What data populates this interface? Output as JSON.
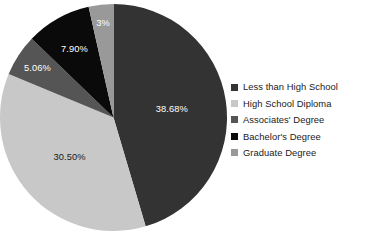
{
  "chart_data": {
    "type": "pie",
    "title": "",
    "subtitle": "",
    "xlabel": "",
    "ylabel": "",
    "legend_position": "right",
    "grid": false,
    "start_angle_deg": 0,
    "direction": "clockwise",
    "categories": [
      "Less than High School",
      "High School Diploma",
      "Associates' Degree",
      "Bachelor's Degree",
      "Graduate Degree"
    ],
    "values": [
      38.68,
      30.5,
      5.06,
      7.9,
      3.0
    ],
    "data_labels": [
      "38.68%",
      "30.50%",
      "5.06%",
      "7.90%",
      "3%"
    ],
    "colors": [
      "#333333",
      "#c8c8c8",
      "#555555",
      "#0a0a0a",
      "#999999"
    ],
    "label_text_colors": [
      "#ffffff",
      "#1a1a1a",
      "#ffffff",
      "#ffffff",
      "#ffffff"
    ],
    "slices": [
      {
        "name": "Less than High School",
        "value": 38.68,
        "label": "38.68%",
        "color": "#333333",
        "label_color": "#ffffff"
      },
      {
        "name": "High School Diploma",
        "value": 30.5,
        "label": "30.50%",
        "color": "#c8c8c8",
        "label_color": "#1a1a1a"
      },
      {
        "name": "Associates' Degree",
        "value": 5.06,
        "label": "5.06%",
        "color": "#555555",
        "label_color": "#ffffff"
      },
      {
        "name": "Bachelor's Degree",
        "value": 7.9,
        "label": "7.90%",
        "color": "#0a0a0a",
        "label_color": "#ffffff"
      },
      {
        "name": "Graduate Degree",
        "value": 3.0,
        "label": "3%",
        "color": "#999999",
        "label_color": "#ffffff"
      }
    ]
  },
  "legend": {
    "items": [
      {
        "label": "Less than High School",
        "color": "#333333"
      },
      {
        "label": "High School Diploma",
        "color": "#c8c8c8"
      },
      {
        "label": "Associates' Degree",
        "color": "#555555"
      },
      {
        "label": "Bachelor's Degree",
        "color": "#0a0a0a"
      },
      {
        "label": "Graduate Degree",
        "color": "#999999"
      }
    ]
  }
}
